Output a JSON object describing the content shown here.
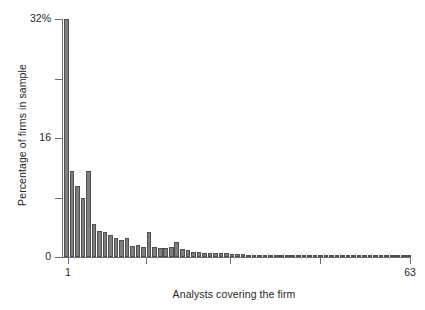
{
  "chart_data": {
    "type": "bar",
    "title": "",
    "subtitle": "",
    "xlabel": "Analysts covering the firm",
    "ylabel": "Percentage of firms in sample",
    "xlim": [
      1,
      63
    ],
    "ylim": [
      0,
      32
    ],
    "grid": false,
    "legend": null,
    "annotations": [],
    "y_tick_labels": [
      "32%",
      "16",
      "0"
    ],
    "y_tick_values": [
      32,
      16,
      0
    ],
    "y_minor_tick_values": [
      24,
      8
    ],
    "x_tick_labels": [
      "1",
      "",
      "",
      "",
      "63"
    ],
    "x_tick_values": [
      1,
      16,
      31,
      47,
      63
    ],
    "bar_fill_color": "#7f7f7f",
    "bar_edge_color": "#4f4f4f",
    "axis_color": "#6e6e6e",
    "background_color": "#ffffff",
    "categories": [
      1,
      2,
      3,
      4,
      5,
      6,
      7,
      8,
      9,
      10,
      11,
      12,
      13,
      14,
      15,
      16,
      17,
      18,
      19,
      20,
      21,
      22,
      23,
      24,
      25,
      26,
      27,
      28,
      29,
      30,
      31,
      32,
      33,
      34,
      35,
      36,
      37,
      38,
      39,
      40,
      41,
      42,
      43,
      44,
      45,
      46,
      47,
      48,
      49,
      50,
      51,
      52,
      53,
      54,
      55,
      56,
      57,
      58,
      59,
      60,
      61,
      62,
      63
    ],
    "values": [
      32.0,
      11.5,
      9.6,
      8.0,
      11.5,
      4.4,
      3.5,
      3.4,
      2.9,
      2.6,
      2.3,
      2.5,
      1.5,
      1.6,
      1.4,
      3.3,
      1.4,
      1.2,
      1.2,
      1.3,
      2.0,
      1.1,
      1.0,
      0.7,
      0.7,
      0.6,
      0.6,
      0.5,
      0.5,
      0.5,
      0.4,
      0.4,
      0.4,
      0.3,
      0.3,
      0.3,
      0.3,
      0.2,
      0.2,
      0.2,
      0.2,
      0.2,
      0.15,
      0.15,
      0.3,
      0.1,
      0.1,
      0.1,
      0.1,
      0.1,
      0.1,
      0.05,
      0.05,
      0.05,
      0.05,
      0.05,
      0.05,
      0.05,
      0.05,
      0.05,
      0.05,
      0.05,
      0.3
    ]
  }
}
